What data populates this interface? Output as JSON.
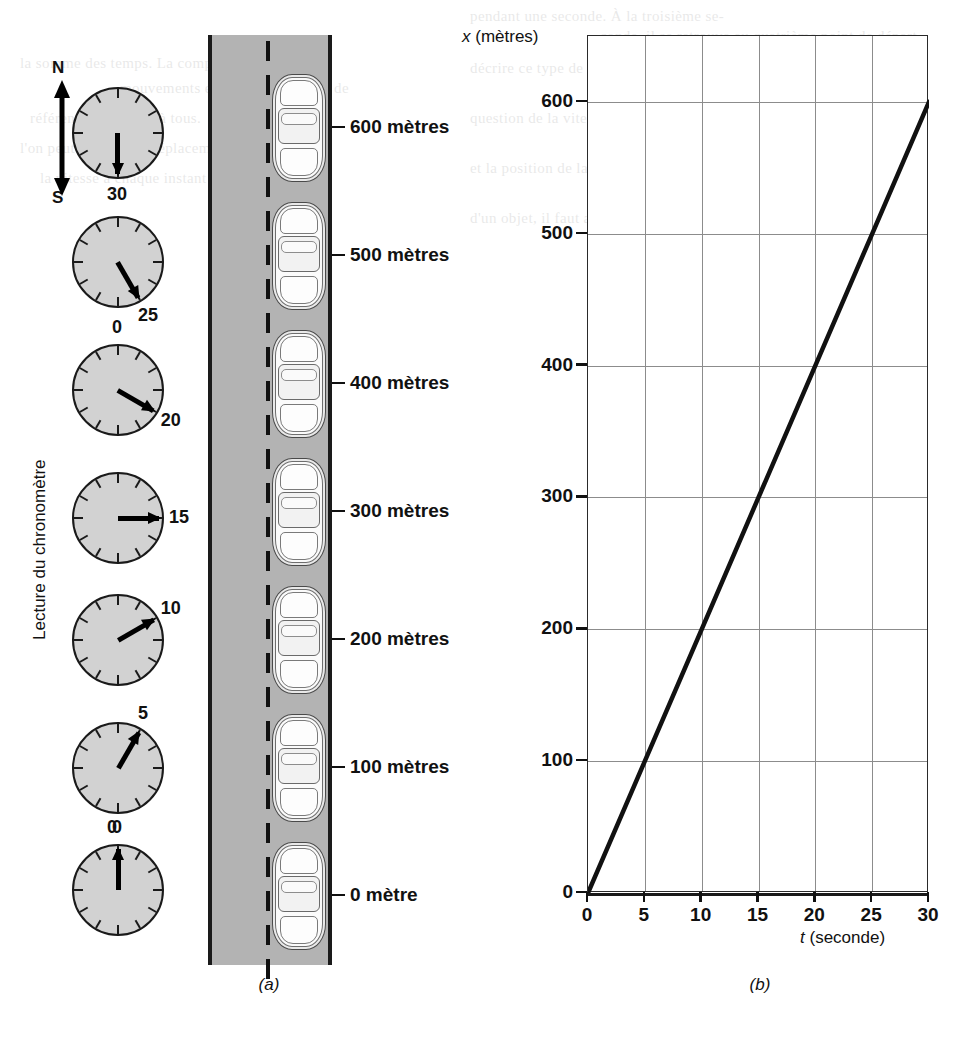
{
  "figure": {
    "panel_a_caption": "(a)",
    "panel_b_caption": "(b)",
    "compass": {
      "north": "N",
      "south": "S"
    },
    "stopwatch_axis_label": "Lecture du chronomètre"
  },
  "stopwatches": [
    {
      "reading": "30",
      "seconds": 30,
      "angle_deg": 180
    },
    {
      "reading": "25",
      "seconds": 25,
      "angle_deg": 150
    },
    {
      "reading": "20",
      "seconds": 20,
      "angle_deg": 120,
      "zero_mark": "0"
    },
    {
      "reading": "15",
      "seconds": 15,
      "angle_deg": 90
    },
    {
      "reading": "10",
      "seconds": 10,
      "angle_deg": 60
    },
    {
      "reading": "5",
      "seconds": 5,
      "angle_deg": 30
    },
    {
      "reading": "0",
      "seconds": 0,
      "angle_deg": 0,
      "zero_mark": "0"
    }
  ],
  "road_positions": [
    {
      "label": "600 mètres",
      "metres": 600
    },
    {
      "label": "500 mètres",
      "metres": 500
    },
    {
      "label": "400 mètres",
      "metres": 400
    },
    {
      "label": "300 mètres",
      "metres": 300
    },
    {
      "label": "200 mètres",
      "metres": 200
    },
    {
      "label": "100 mètres",
      "metres": 100
    },
    {
      "label": "0 mètre",
      "metres": 0
    }
  ],
  "chart_data": {
    "type": "line",
    "title": "",
    "xlabel": "t (seconde)",
    "ylabel": "x (mètres)",
    "xlabel_symbol": "t",
    "xlabel_unit": "(seconde)",
    "ylabel_symbol": "x",
    "ylabel_unit": "(mètres)",
    "x": [
      0,
      5,
      10,
      15,
      20,
      25,
      30
    ],
    "y": [
      0,
      100,
      200,
      300,
      400,
      500,
      600
    ],
    "xticks": [
      "0",
      "5",
      "10",
      "15",
      "20",
      "25",
      "30"
    ],
    "yticks": [
      "0",
      "100",
      "200",
      "300",
      "400",
      "500",
      "600"
    ],
    "xlim": [
      0,
      30
    ],
    "ylim": [
      0,
      650
    ],
    "grid": true,
    "legend": "none",
    "series": [
      {
        "name": "x(t)",
        "values": [
          0,
          100,
          200,
          300,
          400,
          500,
          600
        ],
        "color": "#111111"
      }
    ]
  },
  "colors": {
    "road": "#b3b3b3",
    "clock_face": "#d2d2d2",
    "ink": "#111111",
    "gridline": "#8c8c8c"
  },
  "ghost_text": [
    "pendant une seconde. À la troisième se-",
    "conde, il se retrouve au quatrième point de départ",
    "la somme des temps. La composition de",
    "mouvements est celle qui permet de",
    "décrire ce type de situation avec",
    "précision. Il faut aussi établir un",
    "référentiel commun à tous.",
    "question de la vitesse",
    "prise une seconde à partir de x",
    "l'on peut mesurer le déplacement",
    "et la position de la voiture qui",
    "mouvement uniforme. Si la course",
    "d'un objet, il faut alors, dans ce cas,",
    "la vitesse à chaque instant devient",
    "son accélération."
  ]
}
